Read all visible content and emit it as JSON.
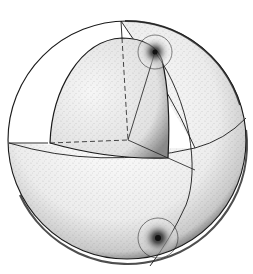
{
  "figure": {
    "caption": "",
    "colors": {
      "ink": "#1a1a1a",
      "stipple": "#2b2b2b",
      "background": "#ffffff",
      "caption": "#9a9a9a"
    },
    "outer_sphere": {
      "cx": 127,
      "cy": 140,
      "r": 120
    },
    "inner_core": {
      "top": [
        122,
        38
      ],
      "corner": [
        128,
        140
      ]
    },
    "point_sources": [
      {
        "name": "upper-source",
        "x": 155,
        "y": 52,
        "halo_r": 17
      },
      {
        "name": "lower-source",
        "x": 158,
        "y": 238,
        "halo_r": 20
      }
    ]
  }
}
